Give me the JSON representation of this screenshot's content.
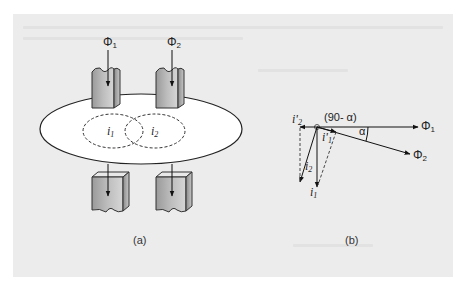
{
  "figure": {
    "panel_color": "#ececec",
    "part_a": {
      "caption": "(a)",
      "flux_labels": [
        {
          "symbol": "Φ",
          "subscript": "1"
        },
        {
          "symbol": "Φ",
          "subscript": "2"
        }
      ],
      "current_loops": [
        {
          "symbol": "i",
          "subscript": "1"
        },
        {
          "symbol": "i",
          "subscript": "2"
        }
      ],
      "description": "Two magnetic pole pieces above and below a conducting disc; eddy current loops i1 and i2 induced in the disc"
    },
    "part_b": {
      "caption": "(b)",
      "angle_label": "(90- α)",
      "alpha_label": "α",
      "vectors": [
        {
          "symbol": "Φ",
          "subscript": "1"
        },
        {
          "symbol": "Φ",
          "subscript": "2"
        },
        {
          "symbol": "i",
          "subscript": "1"
        },
        {
          "symbol": "i",
          "subscript": "2"
        },
        {
          "symbol": "i'",
          "subscript": "1"
        },
        {
          "symbol": "i'",
          "subscript": "2"
        }
      ],
      "description": "Phasor diagram of fluxes and eddy currents"
    }
  }
}
